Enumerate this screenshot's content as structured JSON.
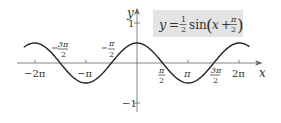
{
  "chart_data": {
    "type": "line",
    "equation": {
      "lhs": "y",
      "eq": "=",
      "coef_num": "1",
      "coef_den": "2",
      "func": "sin",
      "arg_var": "x",
      "plus": "+",
      "arg_num": "π",
      "arg_den": "2"
    },
    "xlabel": "x",
    "ylabel": "y",
    "xlim": [
      -6.6,
      7.2
    ],
    "ylim": [
      -1.2,
      1.3
    ],
    "grid": false,
    "legend": "equation box, top-right",
    "x_ticks": [
      {
        "value": -6.2832,
        "label": "−2π",
        "position": "below"
      },
      {
        "value": -4.7124,
        "label_num": "3π",
        "label_den": "2",
        "sign": "−",
        "position": "above"
      },
      {
        "value": -3.1416,
        "label": "−π",
        "position": "below"
      },
      {
        "value": -1.5708,
        "label_num": "π",
        "label_den": "2",
        "sign": "−",
        "position": "above"
      },
      {
        "value": 1.5708,
        "label_num": "π",
        "label_den": "2",
        "sign": "",
        "position": "below"
      },
      {
        "value": 3.1416,
        "label": "π",
        "position": "below"
      },
      {
        "value": 4.7124,
        "label_num": "3π",
        "label_den": "2",
        "sign": "",
        "position": "below"
      },
      {
        "value": 6.2832,
        "label": "2π",
        "position": "below"
      }
    ],
    "y_ticks": [
      {
        "value": 1,
        "label": "1"
      },
      {
        "value": -1,
        "label": "−1"
      }
    ],
    "series": [
      {
        "name": "y = 1/2 sin(x + π/2)",
        "amplitude": 0.5,
        "phase_shift": 1.5708,
        "x_range": [
          -6.6,
          6.9
        ],
        "points": [
          {
            "x": -6.2832,
            "y": 0.5
          },
          {
            "x": -4.7124,
            "y": 0
          },
          {
            "x": -3.1416,
            "y": -0.5
          },
          {
            "x": -1.5708,
            "y": 0
          },
          {
            "x": 0,
            "y": 0.5
          },
          {
            "x": 1.5708,
            "y": 0
          },
          {
            "x": 3.1416,
            "y": -0.5
          },
          {
            "x": 4.7124,
            "y": 0
          },
          {
            "x": 6.2832,
            "y": 0.5
          }
        ]
      }
    ],
    "colors": {
      "curve": "#222222",
      "axis": "#555555",
      "box_fill": "#e4e4e4"
    }
  }
}
